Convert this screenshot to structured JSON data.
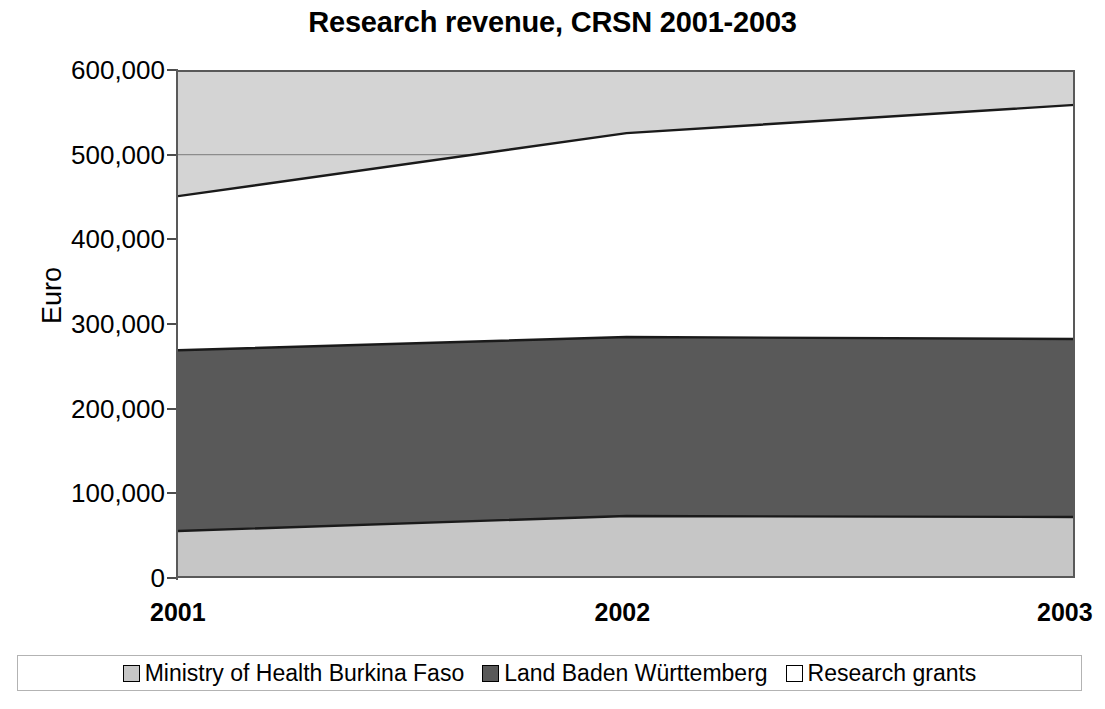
{
  "chart_data": {
    "type": "area",
    "title": "Research revenue, CRSN 2001-2003",
    "xlabel": "",
    "ylabel": "Euro",
    "categories": [
      "2001",
      "2002",
      "2003"
    ],
    "x_tick_labels": [
      "2001",
      "2002",
      "2003"
    ],
    "y_tick_labels": [
      "600,000",
      "500,000",
      "400,000",
      "300,000",
      "200,000",
      "100,000",
      "0"
    ],
    "y_tick_values": [
      600000,
      500000,
      400000,
      300000,
      200000,
      100000,
      0
    ],
    "ylim": [
      0,
      600000
    ],
    "grid": false,
    "stacked": true,
    "legend_position": "bottom",
    "series": [
      {
        "name": "Ministry of Health Burkina Faso",
        "color": "#c6c6c6",
        "values": [
          55500,
          73200,
          72000
        ],
        "cumulative": [
          55500,
          73200,
          72000
        ]
      },
      {
        "name": "Land Baden Württemberg",
        "color": "#595959",
        "values": [
          213500,
          211400,
          210300
        ],
        "cumulative": [
          269000,
          284600,
          282300
        ]
      },
      {
        "name": "Research grants",
        "color": "#ffffff",
        "values": [
          182000,
          240900,
          276500
        ],
        "cumulative": [
          451000,
          525500,
          558800
        ]
      }
    ],
    "plot_background_color": "#d4d4d4",
    "plot_top_value": 600000
  },
  "title": {
    "text": "Research revenue, CRSN 2001-2003"
  },
  "axes": {
    "y_title": "Euro"
  },
  "legend": {
    "entries": [
      {
        "label": "Ministry of Health Burkina Faso",
        "color": "#c6c6c6"
      },
      {
        "label": "Land Baden Württemberg",
        "color": "#595959"
      },
      {
        "label": "Research grants",
        "color": "#ffffff"
      }
    ]
  },
  "colors": {
    "ministry": "#c6c6c6",
    "land": "#595959",
    "grants": "#ffffff",
    "axis": "#595959",
    "text": "#000000",
    "plot_top_band": "#d4d4d4"
  }
}
